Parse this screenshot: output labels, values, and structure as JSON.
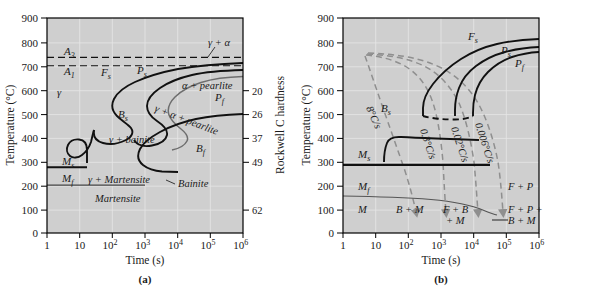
{
  "figure": {
    "panels": [
      {
        "id": "a",
        "caption": "(a)",
        "type": "TTT isothermal transformation diagram",
        "xlabel": "Time (s)",
        "ylabel": "Temperature (°C)",
        "y2label": "Rockwell C hardness",
        "xticks": [
          "1",
          "10",
          "10²",
          "10³",
          "10⁴",
          "10⁵",
          "10⁶"
        ],
        "xtick_exponents": [
          "",
          "",
          "2",
          "3",
          "4",
          "5",
          "6"
        ],
        "xtick_bases": [
          "1",
          "10",
          "10",
          "10",
          "10",
          "10",
          "10"
        ],
        "yticks": [
          "0",
          "100",
          "200",
          "300",
          "400",
          "500",
          "600",
          "700",
          "800",
          "900"
        ],
        "ylim": [
          0,
          900
        ],
        "xlim_log": [
          0,
          6
        ],
        "hardness_ticks": [
          {
            "label": "20",
            "temp": 600
          },
          {
            "label": "26",
            "temp": 500
          },
          {
            "label": "37",
            "temp": 400
          },
          {
            "label": "49",
            "temp": 300
          },
          {
            "label": "62",
            "temp": 100
          }
        ],
        "curve_labels": [
          {
            "name": "A3",
            "base": "A",
            "sub": "3",
            "text": "A₃"
          },
          {
            "name": "A1",
            "base": "A",
            "sub": "1",
            "text": "A₁"
          },
          {
            "name": "Fs",
            "base": "F",
            "sub": "s",
            "text": "Fₛ"
          },
          {
            "name": "Ps",
            "base": "P",
            "sub": "s",
            "text": "Pₛ"
          },
          {
            "name": "Pf",
            "base": "P",
            "sub": "f",
            "text": "Pᶠ"
          },
          {
            "name": "Bs",
            "base": "B",
            "sub": "s",
            "text": "Bₛ"
          },
          {
            "name": "Bf",
            "base": "B",
            "sub": "f",
            "text": "Bᶠ"
          },
          {
            "name": "Ms",
            "base": "M",
            "sub": "s",
            "text": "Mₛ"
          },
          {
            "name": "Mf",
            "base": "M",
            "sub": "f",
            "text": "Mᶠ"
          }
        ],
        "region_labels": [
          "γ",
          "γ + α",
          "α + pearlite",
          "γ + α + pearlite",
          "γ + bainite",
          "γ + Martensite",
          "Martensite",
          "Bainite"
        ],
        "horizontal_lines": [
          {
            "name": "A3",
            "temp": 735,
            "style": "dashed"
          },
          {
            "name": "A1",
            "temp": 700,
            "style": "dashed"
          },
          {
            "name": "Ms",
            "temp": 275,
            "style": "solid-thick"
          },
          {
            "name": "Mf",
            "temp": 200,
            "style": "solid-thin"
          }
        ]
      },
      {
        "id": "b",
        "caption": "(b)",
        "type": "CCT continuous cooling transformation diagram",
        "xlabel": "Time (s)",
        "ylabel": "Temperature (°C)",
        "xticks": [
          "1",
          "10",
          "10²",
          "10³",
          "10⁴",
          "10⁵",
          "10⁶"
        ],
        "xtick_bases": [
          "1",
          "10",
          "10",
          "10",
          "10",
          "10",
          "10"
        ],
        "xtick_exponents": [
          "",
          "",
          "2",
          "3",
          "4",
          "5",
          "6"
        ],
        "yticks": [
          "0",
          "100",
          "200",
          "300",
          "400",
          "500",
          "600",
          "700",
          "800",
          "900"
        ],
        "ylim": [
          0,
          900
        ],
        "xlim_log": [
          0,
          6
        ],
        "cooling_rates": [
          "8°C/s",
          "0.3°C/s",
          "0.02°C/s",
          "0.006°C/s"
        ],
        "curve_labels": [
          {
            "name": "Fs",
            "text": "Fₛ"
          },
          {
            "name": "Ps",
            "text": "Pₛ"
          },
          {
            "name": "Pf",
            "text": "Pᶠ"
          },
          {
            "name": "Bs",
            "text": "Bₛ"
          },
          {
            "name": "Ms",
            "text": "Mₛ"
          },
          {
            "name": "Mf",
            "text": "Mᶠ"
          }
        ],
        "region_labels": [
          "M",
          "B + M",
          "F + B + M",
          "F + P + B + M",
          "F + P"
        ],
        "region_label_parts": {
          "fbm_line1": "F + B",
          "fbm_line2": "+ M",
          "fpbm_line1": "F + P +",
          "fpbm_line2": "B + M",
          "fp": "F + P",
          "m": "M",
          "bm": "B + M"
        },
        "horizontal_lines": [
          {
            "name": "Ms",
            "temp": 285,
            "style": "solid-thick"
          },
          {
            "name": "Mf",
            "temp": 155,
            "style": "solid-thin"
          }
        ]
      }
    ]
  },
  "colors": {
    "plot_background": "#cfcfcf",
    "page_background": "#ffffff",
    "curve": "#111111",
    "grid": "#e8e8e8",
    "axis": "#000000",
    "cooling_curve": "#8a8a8a",
    "secondary_curve": "#777777",
    "text": "#1a1a1a"
  }
}
